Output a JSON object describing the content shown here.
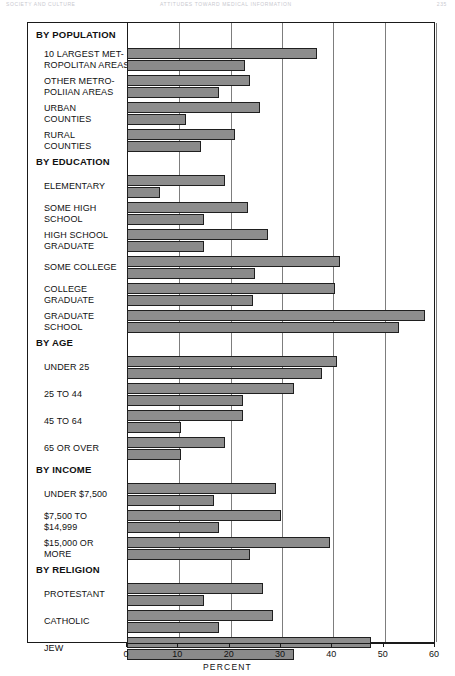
{
  "running_head": {
    "left": "SOCIETY AND CULTURE",
    "center": "ATTITUDES TOWARD MEDICAL INFORMATION",
    "right": "235"
  },
  "chart_data": {
    "type": "bar",
    "orientation": "horizontal",
    "title": "",
    "xlabel": "PERCENT",
    "ylabel": "",
    "xlim": [
      0,
      60
    ],
    "xticks": [
      0,
      10,
      20,
      30,
      40,
      50,
      60
    ],
    "grid": true,
    "legend_position": "none",
    "series": [
      {
        "name": "Series 1"
      },
      {
        "name": "Series 2"
      }
    ],
    "groups": [
      {
        "heading": "BY POPULATION",
        "categories": [
          {
            "label": "10 LARGEST MET-\nROPOLITAN AREAS",
            "values": [
              37,
              23
            ]
          },
          {
            "label": "OTHER METRO-\nPOLIIAN AREAS",
            "values": [
              24,
              18
            ]
          },
          {
            "label": "URBAN\nCOUNTIES",
            "values": [
              26,
              11.5
            ]
          },
          {
            "label": "RURAL\nCOUNTIES",
            "values": [
              21,
              14.5
            ]
          }
        ]
      },
      {
        "heading": "BY EDUCATION",
        "categories": [
          {
            "label": "ELEMENTARY",
            "values": [
              19,
              6.5
            ]
          },
          {
            "label": "SOME HIGH\nSCHOOL",
            "values": [
              23.5,
              15
            ]
          },
          {
            "label": "HIGH SCHOOL\nGRADUATE",
            "values": [
              27.5,
              15
            ]
          },
          {
            "label": "SOME COLLEGE",
            "values": [
              41.5,
              25
            ]
          },
          {
            "label": "COLLEGE\nGRADUATE",
            "values": [
              40.5,
              24.5
            ]
          },
          {
            "label": "GRADUATE\nSCHOOL",
            "values": [
              58,
              53
            ]
          }
        ]
      },
      {
        "heading": "BY AGE",
        "categories": [
          {
            "label": "UNDER 25",
            "values": [
              41,
              38
            ]
          },
          {
            "label": "25 TO 44",
            "values": [
              32.5,
              22.5
            ]
          },
          {
            "label": "45 TO 64",
            "values": [
              22.5,
              10.5
            ]
          },
          {
            "label": "65 OR OVER",
            "values": [
              19,
              10.5
            ]
          }
        ]
      },
      {
        "heading": "BY INCOME",
        "categories": [
          {
            "label": "UNDER $7,500",
            "values": [
              29,
              17
            ]
          },
          {
            "label": "$7,500 TO\n$14,999",
            "values": [
              30,
              18
            ]
          },
          {
            "label": "$15,000 OR\nMORE",
            "values": [
              39.5,
              24
            ]
          }
        ]
      },
      {
        "heading": "BY RELIGION",
        "categories": [
          {
            "label": "PROTESTANT",
            "values": [
              26.5,
              15
            ]
          },
          {
            "label": "CATHOLIC",
            "values": [
              28.5,
              18
            ]
          },
          {
            "label": "JEW",
            "values": [
              47.5,
              32.5
            ]
          }
        ]
      }
    ]
  },
  "colors": {
    "bar_fill": "#8d8d8d",
    "bar_stroke": "#1f1f1f",
    "grid": "#7d7d7d",
    "frame": "#1a1a1a"
  }
}
